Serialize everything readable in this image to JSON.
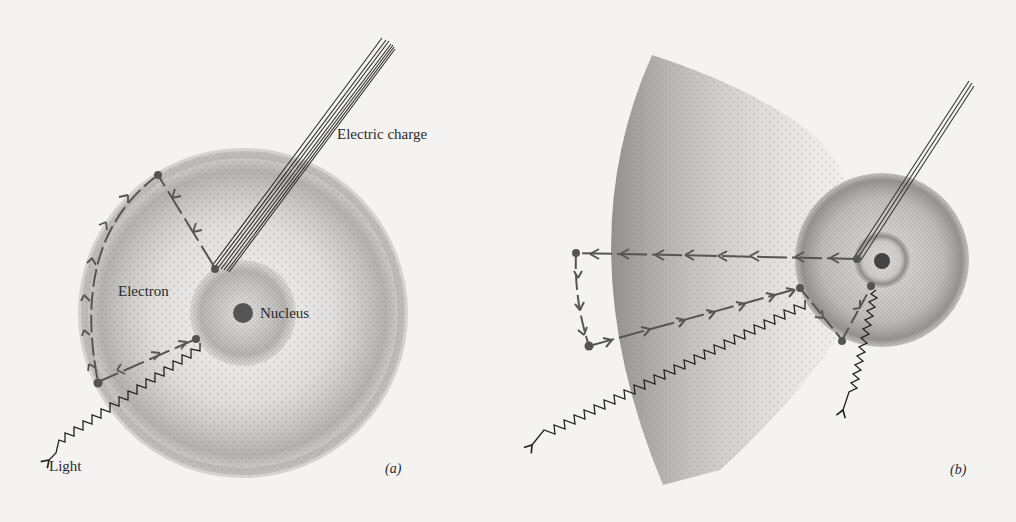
{
  "diagram": {
    "background": "#f4f3f1",
    "ink_color": "#2a2a2a",
    "stipple_color": "#6e6e6e",
    "arrow_color": "#555555",
    "panels": [
      {
        "id": "a",
        "panel_label": "(a)",
        "labels": {
          "electric_charge": "Electric charge",
          "electron": "Electron",
          "nucleus": "Nucleus",
          "light": "Light"
        },
        "elements": {
          "atom_outer_cloud": {
            "cx": 243,
            "cy": 313,
            "r": 162
          },
          "atom_inner_cloud": {
            "cx": 243,
            "cy": 313,
            "r": 53
          },
          "nucleus": {
            "cx": 243,
            "cy": 313,
            "r": 10
          },
          "charge_beam": {
            "from": [
              217,
              268
            ],
            "to": [
              391,
              36
            ],
            "lines": 7
          },
          "excitation_path": [
            [
              215,
              268
            ],
            [
              158,
              175
            ]
          ],
          "relaxation_path_outer": [
            [
              158,
              175
            ],
            [
              98,
              382
            ]
          ],
          "return_path": [
            [
              98,
              382
            ],
            [
              196,
              339
            ]
          ],
          "light_wave": {
            "from": [
              200,
              343
            ],
            "to": [
              30,
              470
            ]
          }
        }
      },
      {
        "id": "b",
        "panel_label": "(b)",
        "elements": {
          "atom_cloud": {
            "cx": 882,
            "cy": 260,
            "r": 87
          },
          "inner_ring": {
            "cx": 882,
            "cy": 260,
            "r": 28
          },
          "nucleus": {
            "cx": 882,
            "cy": 260,
            "r": 8
          },
          "expanded_cloud_fan": {
            "apex_top": [
              652,
              55
            ],
            "apex_bottom": [
              665,
              485
            ]
          },
          "charge_beam": {
            "from": [
              857,
              258
            ],
            "to": [
              972,
              80
            ],
            "lines": 3
          },
          "emission_path": [
            [
              857,
              259
            ],
            [
              576,
              253
            ]
          ],
          "down_path": [
            [
              576,
              253
            ],
            [
              589,
              346
            ]
          ],
          "return_path": [
            [
              589,
              346
            ],
            [
              800,
              288
            ]
          ],
          "relax_path_1": [
            [
              800,
              288
            ],
            [
              842,
              340
            ]
          ],
          "relax_path_2": [
            [
              842,
              340
            ],
            [
              871,
              287
            ]
          ],
          "light_wave_long": {
            "from": [
              805,
              300
            ],
            "to": [
              510,
              425
            ]
          },
          "light_wave_short": {
            "from": [
              876,
              290
            ],
            "to": [
              820,
              418
            ]
          }
        }
      }
    ]
  }
}
